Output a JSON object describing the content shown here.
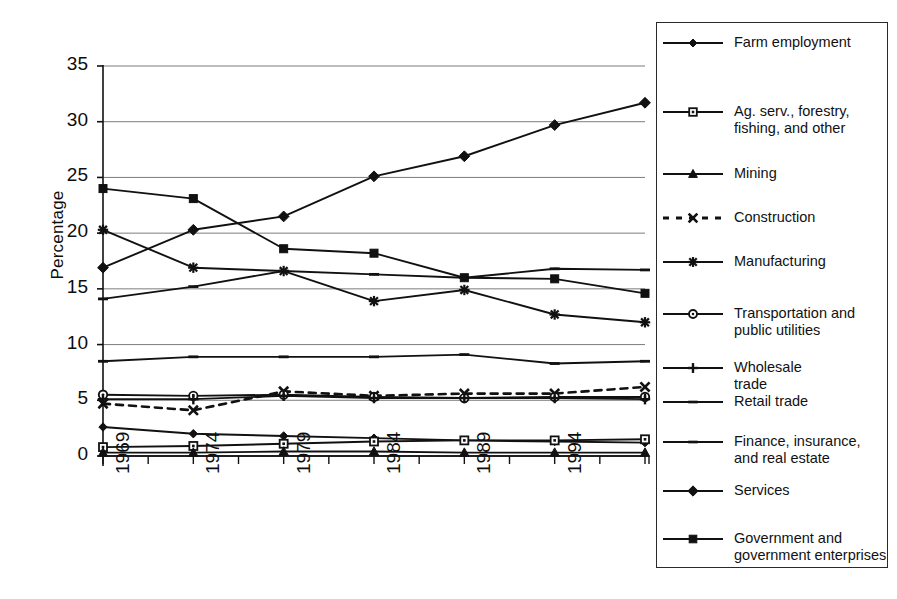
{
  "chart_data": {
    "type": "line",
    "title": "",
    "xlabel": "",
    "ylabel": "Percentage",
    "x": [
      1969,
      1974,
      1979,
      1984,
      1989,
      1994,
      1999
    ],
    "categories": [
      "1969",
      "1974",
      "1979",
      "1984",
      "1989",
      "1994",
      "1999"
    ],
    "ylim": [
      0,
      35
    ],
    "ytick_labels": [
      "0",
      "5",
      "10",
      "15",
      "20",
      "25",
      "30",
      "35"
    ],
    "ytick_values": [
      0,
      5,
      10,
      15,
      20,
      25,
      30,
      35
    ],
    "grid": true,
    "legend_position": "right",
    "series": [
      {
        "name": "Farm employment",
        "marker": "diamond-small",
        "line": "solid",
        "values": [
          2.6,
          2.0,
          1.8,
          1.6,
          1.4,
          1.3,
          1.2
        ]
      },
      {
        "name": "Ag. serv., forestry, fishing, and other",
        "marker": "square-open",
        "line": "solid",
        "values": [
          0.8,
          0.9,
          1.1,
          1.3,
          1.4,
          1.4,
          1.5
        ]
      },
      {
        "name": "Mining",
        "marker": "triangle",
        "line": "solid",
        "values": [
          0.3,
          0.3,
          0.4,
          0.4,
          0.3,
          0.3,
          0.3
        ]
      },
      {
        "name": "Construction",
        "marker": "x-cross",
        "line": "dashed",
        "values": [
          4.7,
          4.1,
          5.8,
          5.4,
          5.6,
          5.6,
          6.2
        ]
      },
      {
        "name": "Manufacturing",
        "marker": "asterisk",
        "line": "solid",
        "values": [
          20.3,
          16.9,
          16.6,
          13.9,
          14.9,
          12.7,
          12.0
        ]
      },
      {
        "name": "Transportation and public utilities",
        "marker": "circle-open",
        "line": "solid",
        "values": [
          5.5,
          5.4,
          5.5,
          5.3,
          5.2,
          5.3,
          5.3
        ]
      },
      {
        "name": "Wholesale trade",
        "marker": "plus",
        "line": "solid",
        "values": [
          5.1,
          5.1,
          5.4,
          5.2,
          5.2,
          5.2,
          5.1
        ]
      },
      {
        "name": "Retail trade",
        "marker": "dash",
        "line": "solid",
        "values": [
          14.1,
          15.2,
          16.6,
          16.3,
          16.0,
          16.8,
          16.7
        ]
      },
      {
        "name": "Finance, insurance, and real estate",
        "marker": "dash",
        "line": "solid",
        "values": [
          8.5,
          8.9,
          8.9,
          8.9,
          9.1,
          8.3,
          8.5
        ]
      },
      {
        "name": "Services",
        "marker": "diamond",
        "line": "solid",
        "values": [
          16.9,
          20.3,
          21.5,
          25.1,
          26.9,
          29.7,
          31.7
        ]
      },
      {
        "name": "Government and government enterprises",
        "marker": "square",
        "line": "solid",
        "values": [
          24.0,
          23.1,
          18.6,
          18.2,
          16.0,
          15.9,
          14.6
        ]
      }
    ]
  },
  "legend": {
    "items": [
      {
        "label_line1": "Farm employment",
        "label_line2": ""
      },
      {
        "label_line1": "Ag. serv., forestry,",
        "label_line2": "fishing, and other"
      },
      {
        "label_line1": "Mining",
        "label_line2": ""
      },
      {
        "label_line1": "Construction",
        "label_line2": ""
      },
      {
        "label_line1": "Manufacturing",
        "label_line2": ""
      },
      {
        "label_line1": "Transportation and",
        "label_line2": "public utilities"
      },
      {
        "label_line1": "Wholesale",
        "label_line2": "trade"
      },
      {
        "label_line1": "Retail trade",
        "label_line2": ""
      },
      {
        "label_line1": "Finance, insurance,",
        "label_line2": "and real estate"
      },
      {
        "label_line1": "Services",
        "label_line2": ""
      },
      {
        "label_line1": "Government and",
        "label_line2": "government enterprises"
      }
    ]
  },
  "colors": {
    "ink": "#111111",
    "grid": "#6e6e6e",
    "background": "#ffffff"
  }
}
